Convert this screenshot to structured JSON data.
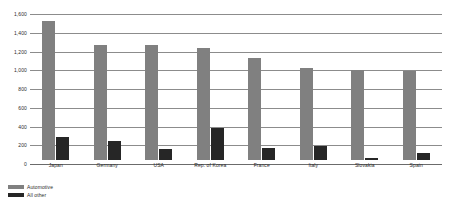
{
  "chart_data": {
    "type": "bar",
    "title": "",
    "subtitle": "",
    "xlabel": "",
    "ylabel": "",
    "ylim": [
      0,
      1600
    ],
    "yticks": [
      "0",
      "200",
      "400",
      "600",
      "800",
      "1,000",
      "1,200",
      "1,400",
      "1,600"
    ],
    "ytick_values": [
      0,
      200,
      400,
      600,
      800,
      1000,
      1200,
      1400,
      1600
    ],
    "grid": true,
    "legend_position": "bottom-left",
    "grouping": "grouped",
    "categories": [
      "Japan",
      "Germany",
      "USA",
      "Rep. of Korea",
      "France",
      "Italy",
      "Slovakia",
      "Spain"
    ],
    "series": [
      {
        "name": "Automotive",
        "color": "#808080",
        "values": [
          1480,
          1230,
          1225,
          1195,
          1090,
          980,
          960,
          950
        ]
      },
      {
        "name": "All other",
        "color": "#262626",
        "values": [
          250,
          205,
          115,
          345,
          125,
          150,
          25,
          75
        ]
      }
    ]
  },
  "legend": {
    "items": [
      {
        "label": "Automotive",
        "color": "#808080"
      },
      {
        "label": "All other",
        "color": "#262626"
      }
    ]
  }
}
